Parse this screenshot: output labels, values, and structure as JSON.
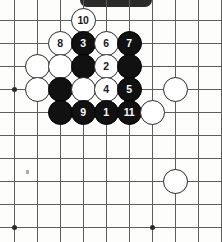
{
  "figure": {
    "board_columns": 10,
    "board_rows": 10,
    "grid_spacing_px": 23,
    "origin_x_px": 14,
    "origin_y_px": 20,
    "colors": {
      "line": "#5d5d5d",
      "black_stone": "#111111",
      "white_stone": "#ffffff",
      "white_stone_border": "#2a2a2a",
      "black_label_text": "#ffffff",
      "white_label_text": "#1a1a1a",
      "background": "#fdfdfc",
      "artifact_bar": "#2b2b2b"
    }
  },
  "star_points": [
    {
      "name": "star-point-left",
      "col": 0,
      "row": 3
    },
    {
      "name": "star-point-bottom-left",
      "col": 0,
      "row": 9
    },
    {
      "name": "star-point-bottom-center",
      "col": 6,
      "row": 9
    }
  ],
  "artifacts": [
    {
      "name": "top-artifact-bar"
    },
    {
      "name": "scan-speck"
    }
  ],
  "stones": [
    {
      "id": "stone-10",
      "color": "white",
      "label": "10",
      "col": 3,
      "row": 0
    },
    {
      "id": "stone-8",
      "color": "white",
      "label": "8",
      "col": 2,
      "row": 1
    },
    {
      "id": "stone-3",
      "color": "black",
      "label": "3",
      "col": 3,
      "row": 1
    },
    {
      "id": "stone-6",
      "color": "white",
      "label": "6",
      "col": 4,
      "row": 1
    },
    {
      "id": "stone-7",
      "color": "black",
      "label": "7",
      "col": 5,
      "row": 1
    },
    {
      "id": "stone-w-c1r2",
      "color": "white",
      "label": "",
      "col": 1,
      "row": 2
    },
    {
      "id": "stone-w-c2r2",
      "color": "white",
      "label": "",
      "col": 2,
      "row": 2
    },
    {
      "id": "stone-b-c3r2",
      "color": "black",
      "label": "",
      "col": 3,
      "row": 2
    },
    {
      "id": "stone-2",
      "color": "white",
      "label": "2",
      "col": 4,
      "row": 2
    },
    {
      "id": "stone-b-c5r2",
      "color": "black",
      "label": "",
      "col": 5,
      "row": 2
    },
    {
      "id": "stone-w-c1r3",
      "color": "white",
      "label": "",
      "col": 1,
      "row": 3
    },
    {
      "id": "stone-b-c2r3",
      "color": "black",
      "label": "",
      "col": 2,
      "row": 3
    },
    {
      "id": "stone-w-c3r3",
      "color": "white",
      "label": "",
      "col": 3,
      "row": 3
    },
    {
      "id": "stone-4",
      "color": "white",
      "label": "4",
      "col": 4,
      "row": 3
    },
    {
      "id": "stone-5",
      "color": "black",
      "label": "5",
      "col": 5,
      "row": 3
    },
    {
      "id": "stone-w-c7r3",
      "color": "white",
      "label": "",
      "col": 7,
      "row": 3
    },
    {
      "id": "stone-b-c2r4",
      "color": "black",
      "label": "",
      "col": 2,
      "row": 4
    },
    {
      "id": "stone-9",
      "color": "black",
      "label": "9",
      "col": 3,
      "row": 4
    },
    {
      "id": "stone-1",
      "color": "black",
      "label": "1",
      "col": 4,
      "row": 4
    },
    {
      "id": "stone-11",
      "color": "black",
      "label": "11",
      "col": 5,
      "row": 4
    },
    {
      "id": "stone-w-c6r4",
      "color": "white",
      "label": "",
      "col": 6,
      "row": 4
    },
    {
      "id": "stone-w-c7r7",
      "color": "white",
      "label": "",
      "col": 7,
      "row": 7
    }
  ],
  "move_sequence": [
    {
      "move": "1",
      "color": "black"
    },
    {
      "move": "2",
      "color": "white"
    },
    {
      "move": "3",
      "color": "black"
    },
    {
      "move": "4",
      "color": "white"
    },
    {
      "move": "5",
      "color": "black"
    },
    {
      "move": "6",
      "color": "white"
    },
    {
      "move": "7",
      "color": "black"
    },
    {
      "move": "8",
      "color": "white"
    },
    {
      "move": "9",
      "color": "black"
    },
    {
      "move": "10",
      "color": "white"
    },
    {
      "move": "11",
      "color": "black"
    }
  ]
}
